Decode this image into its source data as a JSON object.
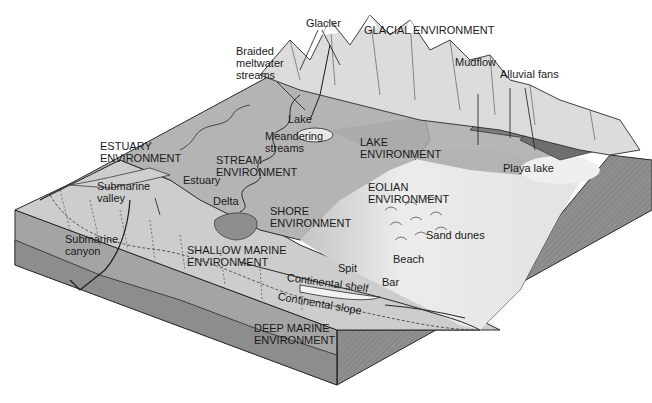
{
  "diagram": {
    "kind": "block diagram of depositional environments",
    "colors": {
      "background": "#ffffff",
      "block_side_dark": "#8a8a8a",
      "block_side_mid": "#a8a8a8",
      "land_surface": "#b9b9b9",
      "shallow_sea": "#cfcfcf",
      "desert_light": "#e6e6e6",
      "mountains": "#d9d9d9",
      "outline": "#2a2a2a"
    },
    "environments": {
      "glacial": "GLACIAL ENVIRONMENT",
      "estuary": "ESTUARY\nENVIRONMENT",
      "stream": "STREAM\nENVIRONMENT",
      "lake": "LAKE\nENVIRONMENT",
      "eolian": "EOLIAN\nENVIRONMENT",
      "shore": "SHORE\nENVIRONMENT",
      "shallow_marine": "SHALLOW MARINE\nENVIRONMENT",
      "deep_marine": "DEEP MARINE\nENVIRONMENT"
    },
    "features": {
      "glacier": "Glacier",
      "braided": "Braided\nmeltwater\nstreams",
      "mudflow": "Mudflow",
      "alluvial_fans": "Alluvial fans",
      "lake": "Lake",
      "meandering": "Meandering\nstreams",
      "playa_lake": "Playa lake",
      "estuary": "Estuary",
      "submarine_valley": "Submarine\nvalley",
      "delta": "Delta",
      "sand_dunes": "Sand dunes",
      "submarine_canyon": "Submarine\ncanyon",
      "beach": "Beach",
      "spit": "Spit",
      "bar": "Bar",
      "continental_shelf": "Continental shelf",
      "continental_slope": "Continental slope"
    }
  }
}
